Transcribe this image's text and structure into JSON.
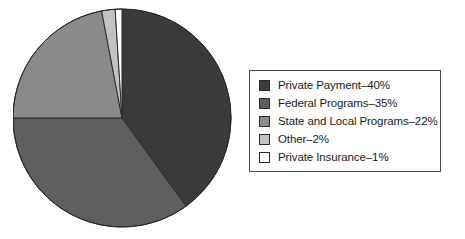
{
  "chart_data": {
    "type": "pie",
    "title": "",
    "subtitle": "",
    "xlabel": "",
    "ylabel": "",
    "grid": false,
    "legend_position": "right",
    "start_angle_deg": 0,
    "direction": "clockwise",
    "categories": [
      "Private Payment",
      "Federal Programs",
      "State and Local Programs",
      "Other",
      "Private Insurance"
    ],
    "values": [
      40,
      35,
      22,
      2,
      1
    ],
    "value_unit": "%",
    "colors": [
      "#3b3b3b",
      "#5e5e5e",
      "#8a8a8a",
      "#c2c2c2",
      "#ffffff"
    ],
    "slices": [
      {
        "label": "Private Payment",
        "value": 40,
        "display": "Private Payment–40%",
        "color": "#3b3b3b"
      },
      {
        "label": "Federal Programs",
        "value": 35,
        "display": "Federal Programs–35%",
        "color": "#5e5e5e"
      },
      {
        "label": "State and Local Programs",
        "value": 22,
        "display": "State and Local Programs–22%",
        "color": "#8a8a8a"
      },
      {
        "label": "Other",
        "value": 2,
        "display": "Other–2%",
        "color": "#c2c2c2"
      },
      {
        "label": "Private Insurance",
        "value": 1,
        "display": "Private Insurance–1%",
        "color": "#ffffff"
      }
    ]
  },
  "legend": {
    "items": [
      {
        "text": "Private Payment–40%",
        "color": "#3b3b3b"
      },
      {
        "text": "Federal Programs–35%",
        "color": "#5e5e5e"
      },
      {
        "text": "State and Local Programs–22%",
        "color": "#8a8a8a"
      },
      {
        "text": "Other–2%",
        "color": "#c2c2c2"
      },
      {
        "text": "Private Insurance–1%",
        "color": "#ffffff"
      }
    ]
  },
  "style": {
    "outline_color": "#2a2a2a",
    "legend_border_color": "#4d4d4d",
    "background": "#ffffff"
  }
}
